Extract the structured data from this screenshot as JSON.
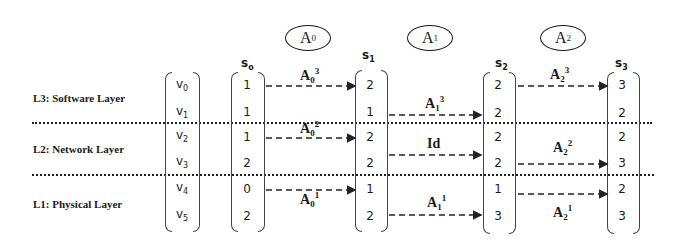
{
  "layers": [
    {
      "label": "L3: Software Layer",
      "vars": [
        "v0",
        "v1"
      ]
    },
    {
      "label": "L2: Network Layer",
      "vars": [
        "v2",
        "v3"
      ]
    },
    {
      "label": "L1: Physical Layer",
      "vars": [
        "v4",
        "v5"
      ]
    }
  ],
  "variables": [
    "v",
    "v",
    "v",
    "v",
    "v",
    "v"
  ],
  "variable_subs": [
    "0",
    "1",
    "2",
    "3",
    "4",
    "5"
  ],
  "states": [
    {
      "name": "s",
      "sub": "o",
      "values": [
        "1",
        "1",
        "1",
        "2",
        "0",
        "2"
      ]
    },
    {
      "name": "s",
      "sub": "1",
      "values": [
        "2",
        "1",
        "2",
        "2",
        "1",
        "2"
      ]
    },
    {
      "name": "s",
      "sub": "2",
      "values": [
        "2",
        "2",
        "2",
        "2",
        "1",
        "3"
      ]
    },
    {
      "name": "s",
      "sub": "3",
      "values": [
        "3",
        "2",
        "2",
        "3",
        "2",
        "3"
      ]
    }
  ],
  "actions": [
    {
      "name": "A",
      "sub": "0"
    },
    {
      "name": "A",
      "sub": "1"
    },
    {
      "name": "A",
      "sub": "2"
    }
  ],
  "transitions": [
    {
      "label": "A",
      "sub": "0",
      "sup": "3",
      "from": "s0",
      "to": "s1",
      "row": 0
    },
    {
      "label": "A",
      "sub": "0",
      "sup": "2",
      "from": "s0",
      "to": "s1",
      "row": 2
    },
    {
      "label": "A",
      "sub": "0",
      "sup": "1",
      "from": "s0",
      "to": "s1",
      "row": 4
    },
    {
      "label": "A",
      "sub": "1",
      "sup": "3",
      "from": "s1",
      "to": "s2",
      "row": 1
    },
    {
      "label": "Id",
      "sub": "",
      "sup": "",
      "from": "s1",
      "to": "s2",
      "row": 2
    },
    {
      "label": "A",
      "sub": "1",
      "sup": "1",
      "from": "s1",
      "to": "s2",
      "row": 5
    },
    {
      "label": "A",
      "sub": "2",
      "sup": "3",
      "from": "s2",
      "to": "s3",
      "row": 0
    },
    {
      "label": "A",
      "sub": "2",
      "sup": "2",
      "from": "s2",
      "to": "s3",
      "row": 3
    },
    {
      "label": "A",
      "sub": "2",
      "sup": "1",
      "from": "s2",
      "to": "s3",
      "row": 4
    }
  ]
}
